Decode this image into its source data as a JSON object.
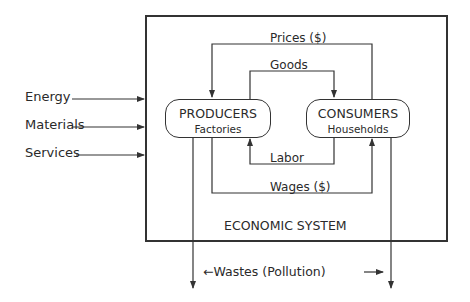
{
  "diagram": {
    "system_label": "ECONOMIC SYSTEM",
    "inputs": [
      {
        "label": "Energy"
      },
      {
        "label": "Materials"
      },
      {
        "label": "Services"
      }
    ],
    "nodes": {
      "producers": {
        "title": "PRODUCERS",
        "subtitle": "Factories"
      },
      "consumers": {
        "title": "CONSUMERS",
        "subtitle": "Households"
      }
    },
    "flows": {
      "prices": "Prices ($)",
      "goods": "Goods",
      "labor": "Labor",
      "wages": "Wages ($)"
    },
    "output": {
      "label": "←Wastes (Pollution)",
      "arrow_right": "→"
    },
    "colors": {
      "line": "#333333",
      "text": "#2a2a2a",
      "background": "#ffffff"
    }
  }
}
